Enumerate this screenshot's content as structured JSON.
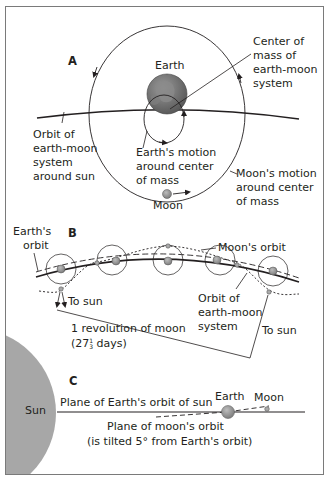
{
  "panels": {
    "a": {
      "letter": "A",
      "earth_label": "Earth",
      "moon_label": "Moon",
      "center_of_mass": [
        "Center of",
        "mass of",
        "earth-moon",
        "system"
      ],
      "orbit_system": [
        "Orbit of",
        "earth-moon",
        "system",
        "around sun"
      ],
      "earth_motion": [
        "Earth's motion",
        "around center",
        "of mass"
      ],
      "moon_motion": [
        "Moon's motion",
        "around center",
        "of mass"
      ]
    },
    "b": {
      "letter": "B",
      "earths_orbit": [
        "Earth's",
        "orbit"
      ],
      "moons_orbit": "Moon's orbit",
      "to_sun_left": "To sun",
      "to_sun_right": "To sun",
      "orbit_system": [
        "Orbit of",
        "earth-moon",
        "system"
      ],
      "revolution": "1 revolution of moon",
      "days_prefix": "(27",
      "days_frac_num": "1",
      "days_frac_den": "3",
      "days_suffix": " days)"
    },
    "c": {
      "letter": "C",
      "sun": "Sun",
      "earth": "Earth",
      "moon": "Moon",
      "plane_earth": "Plane of Earth's orbit of sun",
      "plane_moon": "Plane of moon's orbit",
      "tilt_note": "(is tilted 5° from Earth's orbit)"
    }
  },
  "colors": {
    "ink": "#231f20",
    "sun": "#a7a7a7",
    "earth_ocean": "#6b6b6b",
    "earth_land": "#8e8e8e",
    "body_gray": "#9a9a9a",
    "frame": "#7a7a7a"
  }
}
